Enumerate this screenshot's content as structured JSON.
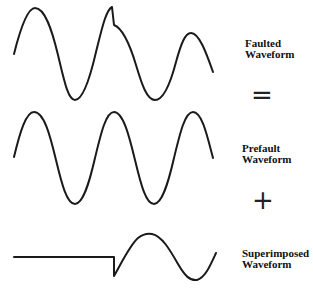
{
  "diagram": {
    "rows": [
      {
        "id": "faulted",
        "label_line1": "Faulted",
        "label_line2": "Waveform"
      },
      {
        "id": "prefault",
        "label_line1": "Prefault",
        "label_line2": "Waveform"
      },
      {
        "id": "superimposed",
        "label_line1": "Superimposed",
        "label_line2": "Waveform"
      }
    ],
    "operators": {
      "equals": "=",
      "plus": "+"
    },
    "colors": {
      "stroke": "#1a1a1a",
      "background": "#ffffff"
    }
  }
}
